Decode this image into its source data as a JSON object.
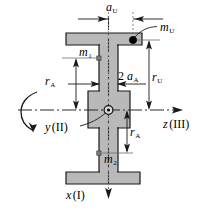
{
  "diagram": {
    "type": "engineering-schematic",
    "colors": {
      "body_fill": "#b9b9b9",
      "outline": "#1a1a1a",
      "axis_line": "#2b2b2b",
      "centerline": "#7a7a7a",
      "marker_fill": "#000000",
      "background": "#ffffff"
    },
    "labels": {
      "a_u": {
        "base": "a",
        "sub": "U",
        "text": "a_U"
      },
      "m_u": {
        "base": "m",
        "sub": "U",
        "text": "m_U"
      },
      "m_1": {
        "base": "m",
        "sub": "1",
        "text": "m_1"
      },
      "m_2": {
        "base": "m",
        "sub": "2",
        "text": "m_2"
      },
      "two_a_a": {
        "prefix": "2 ",
        "base": "a",
        "sub": "A",
        "text": "2 a_A"
      },
      "r_u": {
        "base": "r",
        "sub": "U",
        "text": "r_U"
      },
      "r_a_upper": {
        "base": "r",
        "sub": "A",
        "text": "r_A"
      },
      "r_a_lower": {
        "base": "r",
        "sub": "A",
        "text": "r_A"
      },
      "axis_x": {
        "base": "x",
        "paren": "(I)",
        "text": "x (I)"
      },
      "axis_y": {
        "base": "y",
        "paren": "(II)",
        "text": "y (II)"
      },
      "axis_z": {
        "base": "z",
        "paren": "(III)",
        "text": "z (III)"
      }
    },
    "markers": [
      {
        "name": "unbalance-mass-u",
        "label": "m_U",
        "style": "filled-dot"
      },
      {
        "name": "balance-mass-1",
        "label": "m_1",
        "style": "small-square"
      },
      {
        "name": "balance-mass-2",
        "label": "m_2",
        "style": "small-square"
      },
      {
        "name": "origin",
        "label": "origin",
        "style": "circle-dot"
      }
    ],
    "rotation": {
      "name": "rotation-arc",
      "description": "curved arrow about x-axis"
    }
  }
}
